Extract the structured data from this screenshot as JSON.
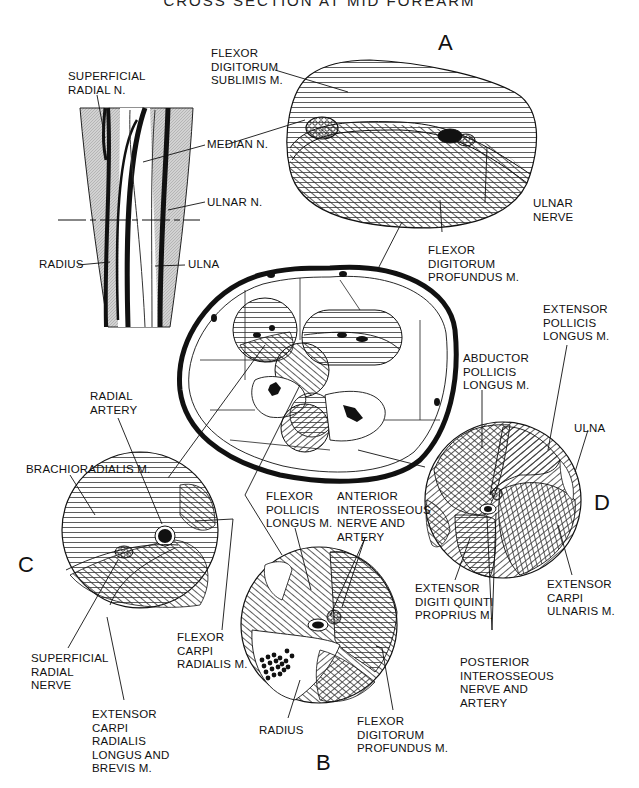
{
  "title": "CROSS SECTION AT MID FOREARM",
  "panels": {
    "A": "A",
    "B": "B",
    "C": "C",
    "D": "D"
  },
  "labels": {
    "superficial_radial_n": "SUPERFICIAL\nRADIAL N.",
    "median_n": "MEDIAN N.",
    "ulnar_n": "ULNAR N.",
    "radius_forearm": "RADIUS",
    "ulna_forearm": "ULNA",
    "fds": "FLEXOR\nDIGITORUM\nSUBLIMIS M.",
    "ulnar_nerve": "ULNAR\nNERVE",
    "fdp_a": "FLEXOR\nDIGITORUM\nPROFUNDUS M.",
    "extensor_pollicis_longus": "EXTENSOR\nPOLLICIS\nLONGUS M.",
    "abductor_pollicis_longus": "ABDUCTOR\nPOLLICIS\nLONGUS M.",
    "ulna_d": "ULNA",
    "radial_artery": "RADIAL\nARTERY",
    "brachioradialis": "BRACHIORADIALIS M.",
    "flexor_pollicis_longus": "FLEXOR\nPOLLICIS\nLONGUS M.",
    "anterior_interosseous": "ANTERIOR\nINTEROSSEOUS\nNERVE AND\nARTERY",
    "extensor_digiti_quinti": "EXTENSOR\nDIGITI QUINTI\nPROPRIUS M.",
    "extensor_carpi_ulnaris": "EXTENSOR\nCARPI\nULNARIS M.",
    "superficial_radial_nerve": "SUPERFICIAL\nRADIAL\nNERVE",
    "flexor_carpi_radialis": "FLEXOR\nCARPI\nRADIALIS M.",
    "posterior_interosseous": "POSTERIOR\nINTEROSSEOUS\nNERVE AND\nARTERY",
    "extensor_carpi_radialis": "EXTENSOR\nCARPI\nRADIALIS\nLONGUS AND\nBREVIS M.",
    "radius_b": "RADIUS",
    "fdp_b": "FLEXOR\nDIGITORUM\nPROFUNDUS M."
  }
}
